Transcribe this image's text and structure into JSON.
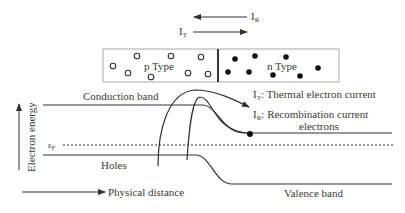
{
  "diagram": {
    "top_arrows": {
      "recombination_label": "I",
      "recombination_sub": "R",
      "thermal_label": "I",
      "thermal_sub": "T"
    },
    "junction": {
      "p_label": "p Type",
      "n_label": "n Type",
      "holes": [
        [
          113,
          66
        ],
        [
          128,
          73
        ],
        [
          137,
          56
        ],
        [
          151,
          77
        ],
        [
          171,
          56
        ],
        [
          188,
          73
        ],
        [
          201,
          57
        ],
        [
          208,
          74
        ]
      ],
      "electrons": [
        [
          235,
          59
        ],
        [
          255,
          56
        ],
        [
          286,
          57
        ],
        [
          228,
          72
        ],
        [
          249,
          72
        ],
        [
          273,
          75
        ],
        [
          300,
          76
        ],
        [
          318,
          68
        ]
      ]
    },
    "bands": {
      "conduction_label": "Conduction band",
      "valence_label": "Valence band",
      "holes_label": "Holes",
      "fermi_label": "ε",
      "fermi_sub": "F"
    },
    "legend": {
      "thermal_prefix": "I",
      "thermal_sub": "T",
      "thermal_text": ": Thermal electron current",
      "recomb_prefix": "I",
      "recomb_sub": "R",
      "recomb_text": ": Recombination current",
      "electrons_text": "electrons"
    },
    "axes": {
      "y_label": "Electron energy",
      "x_label": "Physical distance"
    },
    "colors": {
      "line": "#333333",
      "text": "#3a3a3a",
      "box_border": "#aaaaaa"
    }
  }
}
